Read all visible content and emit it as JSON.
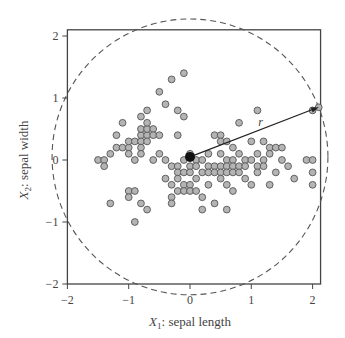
{
  "chart_data": {
    "type": "scatter",
    "title": "",
    "xlabel": "X1: sepal length",
    "ylabel": "X2: sepal width",
    "xlabel_parts": {
      "var": "X",
      "sub": "1",
      "rest": ": sepal length"
    },
    "ylabel_parts": {
      "var": "X",
      "sub": "2",
      "rest": ": sepal width"
    },
    "xlim": [
      -2,
      2.13
    ],
    "ylim": [
      -2,
      2.1
    ],
    "xticks": [
      -2,
      -1,
      0,
      1,
      2
    ],
    "yticks": [
      -2,
      -1,
      0,
      1,
      2
    ],
    "grid": false,
    "legend": null,
    "center": {
      "x": 0.0,
      "y": 0.05,
      "label": "mean"
    },
    "radius_label": "r",
    "radius": 2.25,
    "radius_endpoint": {
      "x": 2.1,
      "y": 0.85
    },
    "colors": {
      "point_fill": "#b4b4b4",
      "point_stroke": "#555555",
      "center": "#111111",
      "axis": "#444444",
      "circle": "#555555"
    },
    "points": [
      [
        -1.5,
        0.0
      ],
      [
        -1.4,
        0.0
      ],
      [
        -1.4,
        -0.1
      ],
      [
        -1.3,
        0.1
      ],
      [
        -1.3,
        -0.7
      ],
      [
        -1.2,
        0.2
      ],
      [
        -1.2,
        0.4
      ],
      [
        -1.1,
        0.2
      ],
      [
        -1.1,
        0.6
      ],
      [
        -1.0,
        0.2
      ],
      [
        -1.0,
        0.3
      ],
      [
        -1.0,
        0.1
      ],
      [
        -1.0,
        -0.5
      ],
      [
        -1.0,
        -0.6
      ],
      [
        -0.9,
        0.3
      ],
      [
        -0.9,
        0.0
      ],
      [
        -0.9,
        -0.5
      ],
      [
        -0.9,
        -1.0
      ],
      [
        -0.8,
        0.4
      ],
      [
        -0.8,
        0.5
      ],
      [
        -0.8,
        0.7
      ],
      [
        -0.8,
        0.3
      ],
      [
        -0.8,
        0.2
      ],
      [
        -0.8,
        0.1
      ],
      [
        -0.8,
        -0.7
      ],
      [
        -0.7,
        0.4
      ],
      [
        -0.7,
        0.5
      ],
      [
        -0.7,
        0.6
      ],
      [
        -0.7,
        0.8
      ],
      [
        -0.7,
        0.3
      ],
      [
        -0.7,
        -0.8
      ],
      [
        -0.6,
        0.5
      ],
      [
        -0.6,
        0.4
      ],
      [
        -0.6,
        0.0
      ],
      [
        -0.5,
        1.1
      ],
      [
        -0.5,
        0.1
      ],
      [
        -0.5,
        0.4
      ],
      [
        -0.4,
        0.9
      ],
      [
        -0.4,
        0.0
      ],
      [
        -0.4,
        -0.3
      ],
      [
        -0.3,
        1.3
      ],
      [
        -0.3,
        -0.1
      ],
      [
        -0.3,
        -0.4
      ],
      [
        -0.3,
        -0.6
      ],
      [
        -0.3,
        -0.7
      ],
      [
        -0.2,
        0.8
      ],
      [
        -0.2,
        0.4
      ],
      [
        -0.2,
        -0.1
      ],
      [
        -0.2,
        -0.2
      ],
      [
        -0.2,
        -0.3
      ],
      [
        -0.2,
        -0.5
      ],
      [
        -0.1,
        1.4
      ],
      [
        -0.1,
        0.7
      ],
      [
        -0.1,
        0.0
      ],
      [
        -0.1,
        -0.2
      ],
      [
        -0.1,
        -0.4
      ],
      [
        -0.1,
        -0.5
      ],
      [
        0.0,
        0.1
      ],
      [
        0.0,
        -0.1
      ],
      [
        0.0,
        -0.2
      ],
      [
        0.0,
        -0.4
      ],
      [
        0.0,
        -0.5
      ],
      [
        0.1,
        0.0
      ],
      [
        0.1,
        -0.1
      ],
      [
        0.1,
        -0.3
      ],
      [
        0.1,
        -0.5
      ],
      [
        0.2,
        0.0
      ],
      [
        0.2,
        -0.2
      ],
      [
        0.2,
        -0.6
      ],
      [
        0.2,
        -0.8
      ],
      [
        0.3,
        0.1
      ],
      [
        0.3,
        -0.1
      ],
      [
        0.3,
        -0.2
      ],
      [
        0.3,
        -0.4
      ],
      [
        0.4,
        0.4
      ],
      [
        0.4,
        -0.1
      ],
      [
        0.4,
        -0.2
      ],
      [
        0.4,
        -0.7
      ],
      [
        0.5,
        0.4
      ],
      [
        0.5,
        0.3
      ],
      [
        0.5,
        0.1
      ],
      [
        0.5,
        -0.1
      ],
      [
        0.5,
        -0.2
      ],
      [
        0.5,
        -0.3
      ],
      [
        0.6,
        0.3
      ],
      [
        0.6,
        0.0
      ],
      [
        0.6,
        -0.1
      ],
      [
        0.6,
        -0.2
      ],
      [
        0.6,
        -0.4
      ],
      [
        0.6,
        -0.8
      ],
      [
        0.7,
        0.2
      ],
      [
        0.7,
        0.0
      ],
      [
        0.7,
        -0.1
      ],
      [
        0.7,
        -0.2
      ],
      [
        0.7,
        -0.5
      ],
      [
        0.8,
        0.6
      ],
      [
        0.8,
        0.1
      ],
      [
        0.8,
        -0.1
      ],
      [
        0.8,
        -0.2
      ],
      [
        0.9,
        0.0
      ],
      [
        0.9,
        -0.1
      ],
      [
        0.9,
        -0.3
      ],
      [
        1.0,
        0.3
      ],
      [
        1.0,
        0.0
      ],
      [
        1.0,
        -0.4
      ],
      [
        1.1,
        0.1
      ],
      [
        1.1,
        -0.1
      ],
      [
        1.1,
        -0.2
      ],
      [
        1.2,
        0.0
      ],
      [
        1.2,
        -0.1
      ],
      [
        1.2,
        0.3
      ],
      [
        1.3,
        0.2
      ],
      [
        1.3,
        0.1
      ],
      [
        1.3,
        -0.4
      ],
      [
        1.4,
        0.2
      ],
      [
        1.4,
        -0.2
      ],
      [
        1.5,
        0.0
      ],
      [
        1.5,
        0.2
      ],
      [
        1.6,
        -0.1
      ],
      [
        1.7,
        -0.3
      ],
      [
        1.9,
        0.0
      ],
      [
        2.0,
        0.0
      ],
      [
        2.0,
        -0.2
      ],
      [
        2.0,
        -0.4
      ],
      [
        1.1,
        0.8
      ],
      [
        2.0,
        0.8
      ],
      [
        2.1,
        0.85
      ]
    ]
  }
}
